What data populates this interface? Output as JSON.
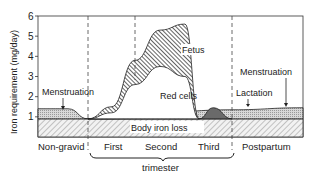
{
  "chart_data": {
    "type": "area",
    "title": "",
    "ylabel": "Iron requirement (mg/day)",
    "xlabel": "trimester",
    "ylim": [
      0,
      6
    ],
    "yticks": [
      "1",
      "2",
      "3",
      "4",
      "5",
      "6"
    ],
    "phases": [
      "Non-gravid",
      "First",
      "Second",
      "Third",
      "Postpartum"
    ],
    "trimester_bracket_label": "trimester",
    "grid": false,
    "layers": [
      {
        "name": "Body iron loss",
        "pattern": "light-hatch",
        "x": [
          0,
          1,
          2,
          3,
          4,
          5
        ],
        "values": [
          0.9,
          0.9,
          0.9,
          0.9,
          0.9,
          0.9
        ]
      },
      {
        "name": "Menstruation",
        "pattern": "dots",
        "x": [
          0,
          0.6,
          1,
          1.3,
          4,
          5
        ],
        "values": [
          1.4,
          1.4,
          0.9,
          0.9,
          1.35,
          1.45
        ]
      },
      {
        "name": "Red cells",
        "pattern": "white",
        "x": [
          1,
          1.5,
          2,
          2.5,
          3,
          3.3
        ],
        "values": [
          0.9,
          1.2,
          2.6,
          3.5,
          3.0,
          0.9
        ]
      },
      {
        "name": "Fetus",
        "pattern": "dense-hatch",
        "x": [
          1,
          1.5,
          2,
          2.5,
          3,
          3.3
        ],
        "values": [
          0.9,
          1.5,
          3.8,
          5.3,
          5.6,
          0.9
        ]
      },
      {
        "name": "Lactation",
        "pattern": "dark-dots",
        "x": [
          3.3,
          3.6,
          4
        ],
        "values": [
          0.9,
          1.45,
          0.9
        ]
      }
    ],
    "annotations": [
      "Menstruation",
      "Red cells",
      "Fetus",
      "Body iron loss",
      "Lactation",
      "Menstruation"
    ]
  }
}
